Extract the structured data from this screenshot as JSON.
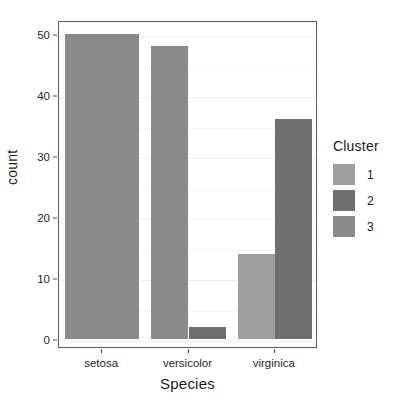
{
  "chart_data": {
    "type": "bar",
    "title": "",
    "subtitle": "",
    "xlabel": "Species",
    "ylabel": "count",
    "categories": [
      "setosa",
      "versicolor",
      "virginica"
    ],
    "legend_title": "Cluster",
    "legend_position": "right",
    "grid": true,
    "ylim": [
      0,
      52
    ],
    "yticks": [
      0,
      10,
      20,
      30,
      40,
      50
    ],
    "ytick_labels": [
      "0",
      "10",
      "20",
      "30",
      "40",
      "50"
    ],
    "series": [
      {
        "name": "1",
        "color": "#9e9e9e",
        "values": [
          0,
          0,
          14
        ]
      },
      {
        "name": "2",
        "color": "#6f6f6f",
        "values": [
          0,
          2,
          36
        ]
      },
      {
        "name": "3",
        "color": "#8a8a8a",
        "values": [
          50,
          48,
          0
        ]
      }
    ],
    "bars": [
      {
        "category": "setosa",
        "series": "3",
        "value": 50,
        "color": "#8a8a8a"
      },
      {
        "category": "versicolor",
        "series": "3",
        "value": 48,
        "color": "#8a8a8a"
      },
      {
        "category": "versicolor",
        "series": "2",
        "value": 2,
        "color": "#6f6f6f"
      },
      {
        "category": "virginica",
        "series": "1",
        "value": 14,
        "color": "#9e9e9e"
      },
      {
        "category": "virginica",
        "series": "2",
        "value": 36,
        "color": "#6f6f6f"
      }
    ]
  },
  "axes": {
    "y_title": "count",
    "x_title": "Species",
    "y_tick_labels": [
      "50",
      "40",
      "30",
      "20",
      "10",
      "0"
    ],
    "x_tick_labels": [
      "setosa",
      "versicolor",
      "virginica"
    ]
  },
  "legend": {
    "title": "Cluster",
    "items": [
      {
        "label": "1",
        "color": "#9e9e9e"
      },
      {
        "label": "2",
        "color": "#6f6f6f"
      },
      {
        "label": "3",
        "color": "#8a8a8a"
      }
    ]
  },
  "colors": {
    "panel_border": "#5a5a5a",
    "grid_major": "#ededed",
    "grid_minor": "#f6f6f6",
    "background": "#ffffff",
    "text": "#1a1a1a"
  }
}
